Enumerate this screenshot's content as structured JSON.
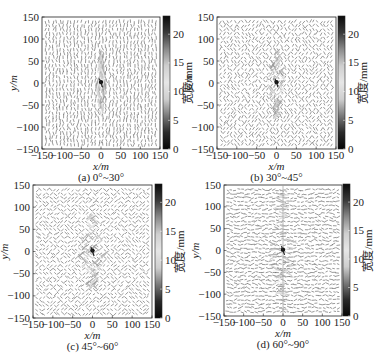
{
  "chart_data": [
    {
      "type": "heatmap",
      "panel": "a",
      "caption": "(a) 0°~30°",
      "orientation_range_deg": [
        0,
        30
      ],
      "xlabel": "x/m",
      "ylabel": "y/m",
      "xlim": [
        -150,
        150
      ],
      "ylim": [
        -150,
        150
      ],
      "xticks": [
        -150,
        -100,
        -50,
        0,
        50,
        100,
        150
      ],
      "yticks": [
        -150,
        -100,
        -50,
        0,
        50,
        100,
        150
      ],
      "colorbar": {
        "label": "宽度/mm",
        "ticks": [
          0,
          5,
          10,
          15,
          20
        ],
        "range": [
          0,
          23
        ]
      },
      "hydraulic_zone": {
        "x_half_width": 15,
        "y_half_height": 70
      },
      "layout": {
        "left": 42,
        "top": 17,
        "width": 118,
        "height": 132,
        "cbar_left": 163,
        "cbar_width": 7
      }
    },
    {
      "type": "heatmap",
      "panel": "b",
      "caption": "(b) 30°~45°",
      "orientation_range_deg": [
        30,
        45
      ],
      "xlabel": "x/m",
      "ylabel": "y/m",
      "xlim": [
        -150,
        150
      ],
      "ylim": [
        -150,
        150
      ],
      "xticks": [
        -150,
        -100,
        -50,
        0,
        50,
        100,
        150
      ],
      "yticks": [
        -150,
        -100,
        -50,
        0,
        50,
        100,
        150
      ],
      "colorbar": {
        "label": "宽度/mm",
        "ticks": [
          0,
          5,
          10,
          15,
          20
        ],
        "range": [
          0,
          23
        ]
      },
      "hydraulic_zone": {
        "x_half_width": 25,
        "y_half_height": 75
      },
      "layout": {
        "left": 217,
        "top": 17,
        "width": 119,
        "height": 132,
        "cbar_left": 338,
        "cbar_width": 7
      }
    },
    {
      "type": "heatmap",
      "panel": "c",
      "caption": "(c) 45°~60°",
      "orientation_range_deg": [
        45,
        60
      ],
      "xlabel": "x/m",
      "ylabel": "y/m",
      "xlim": [
        -150,
        150
      ],
      "ylim": [
        -150,
        150
      ],
      "xticks": [
        -150,
        -100,
        -50,
        0,
        50,
        100,
        150
      ],
      "yticks": [
        -150,
        -100,
        -50,
        0,
        50,
        100,
        150
      ],
      "colorbar": {
        "label": "宽度/mm",
        "ticks": [
          0,
          5,
          10,
          15,
          20
        ],
        "range": [
          0,
          23
        ]
      },
      "hydraulic_zone": {
        "x_half_width": 35,
        "y_half_height": 80
      },
      "layout": {
        "left": 33,
        "top": 185,
        "width": 119,
        "height": 133,
        "cbar_left": 155,
        "cbar_width": 7
      }
    },
    {
      "type": "heatmap",
      "panel": "d",
      "caption": "(d) 60°~90°",
      "orientation_range_deg": [
        60,
        90
      ],
      "xlabel": "x/m",
      "ylabel": "y/m",
      "xlim": [
        -150,
        150
      ],
      "ylim": [
        -150,
        150
      ],
      "xticks": [
        -150,
        -100,
        -50,
        0,
        50,
        100,
        150
      ],
      "yticks": [
        -150,
        -100,
        -50,
        0,
        50,
        100,
        150
      ],
      "colorbar": {
        "label": "宽度/mm",
        "ticks": [
          0,
          5,
          10,
          15,
          20
        ],
        "range": [
          0,
          23
        ]
      },
      "hydraulic_zone": {
        "x_half_width": 35,
        "y_half_height": 140
      },
      "layout": {
        "left": 224,
        "top": 185,
        "width": 118,
        "height": 131,
        "cbar_left": 343,
        "cbar_width": 7
      }
    }
  ],
  "figure": {
    "bottom_caption": "",
    "colorbar_stops": [
      "#0a0a0a",
      "#3a3a3a",
      "#8a8a8a",
      "#cfcfcf",
      "#e6e6e6",
      "#cfcfcf",
      "#7a7a7a",
      "#2a2a2a",
      "#050505"
    ]
  }
}
